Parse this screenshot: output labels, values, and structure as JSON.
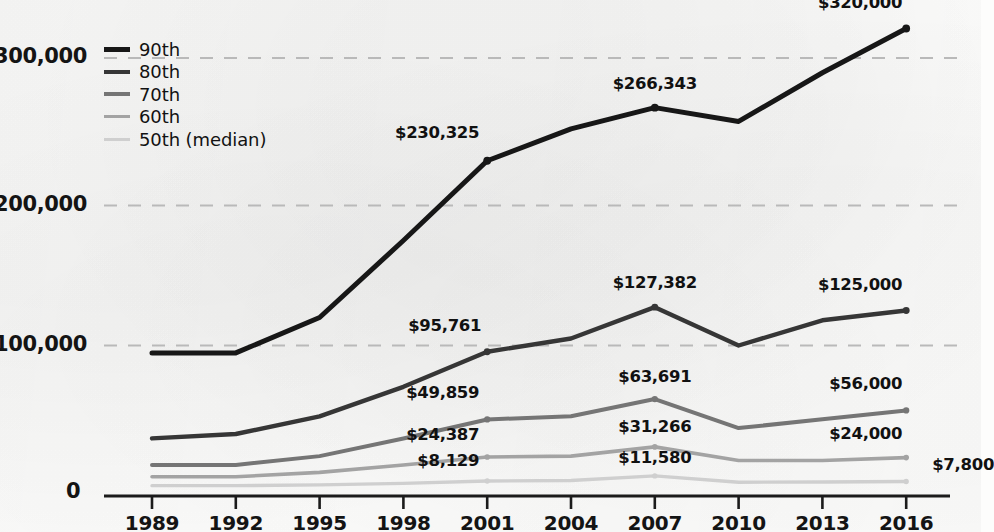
{
  "chart_data": {
    "type": "line",
    "title": "",
    "xlabel": "",
    "ylabel": "",
    "categories": [
      "1989",
      "1992",
      "1995",
      "1998",
      "2001",
      "2004",
      "2007",
      "2010",
      "2013",
      "2016"
    ],
    "ylim": [
      0,
      340000
    ],
    "yticks": [
      0,
      100000,
      200000,
      300000
    ],
    "ytick_labels": [
      "0",
      "100,000",
      "200,000",
      "300,000"
    ],
    "grid": "horizontal-dashed",
    "legend_position": "top-left",
    "series": [
      {
        "name": "90th",
        "color": "#171717",
        "width": 5.0,
        "values": [
          95000,
          95000,
          120000,
          175000,
          230325,
          252000,
          266343,
          257000,
          290000,
          320000
        ],
        "labels": [
          {
            "category": "2001",
            "text": "$230,325"
          },
          {
            "category": "2007",
            "text": "$266,343"
          },
          {
            "category": "2016",
            "text": "$320,000"
          }
        ]
      },
      {
        "name": "80th",
        "color": "#363636",
        "width": 4.4,
        "values": [
          37000,
          40000,
          52000,
          72000,
          95761,
          105000,
          127382,
          100000,
          118000,
          125000
        ],
        "labels": [
          {
            "category": "2001",
            "text": "$95,761"
          },
          {
            "category": "2007",
            "text": "$127,382"
          },
          {
            "category": "2016",
            "text": "$125,000"
          }
        ]
      },
      {
        "name": "70th",
        "color": "#757575",
        "width": 4.0,
        "values": [
          19000,
          19000,
          25000,
          37000,
          49859,
          52000,
          63691,
          44000,
          50000,
          56000
        ],
        "labels": [
          {
            "category": "2001",
            "text": "$49,859"
          },
          {
            "category": "2007",
            "text": "$63,691"
          },
          {
            "category": "2016",
            "text": "$56,000"
          }
        ]
      },
      {
        "name": "60th",
        "color": "#a3a3a3",
        "width": 3.6,
        "values": [
          11000,
          11000,
          14000,
          19000,
          24387,
          25000,
          31266,
          22000,
          22000,
          24000
        ],
        "labels": [
          {
            "category": "2001",
            "text": "$24,387"
          },
          {
            "category": "2007",
            "text": "$31,266"
          },
          {
            "category": "2016",
            "text": "$24,000"
          }
        ]
      },
      {
        "name": "50th (median)",
        "color": "#cfcfcf",
        "width": 3.4,
        "values": [
          5000,
          5000,
          5500,
          6500,
          8129,
          8500,
          11580,
          7300,
          7500,
          7800
        ],
        "labels": [
          {
            "category": "2001",
            "text": "$8,129"
          },
          {
            "category": "2007",
            "text": "$11,580"
          },
          {
            "category": "2016",
            "text": "$7,800"
          }
        ]
      }
    ]
  },
  "axis": {
    "y_labels": [
      {
        "text": "300,000",
        "value": 300000
      },
      {
        "text": "200,000",
        "value": 200000
      },
      {
        "text": "100,000",
        "value": 100000
      },
      {
        "text": "0",
        "value": 0
      }
    ],
    "x_labels": [
      "1989",
      "1992",
      "1995",
      "1998",
      "2001",
      "2004",
      "2007",
      "2010",
      "2013",
      "2016"
    ]
  },
  "legend": {
    "items": [
      {
        "label": "90th",
        "color": "#171717"
      },
      {
        "label": "80th",
        "color": "#363636"
      },
      {
        "label": "70th",
        "color": "#757575"
      },
      {
        "label": "60th",
        "color": "#a3a3a3"
      },
      {
        "label": "50th (median)",
        "color": "#cfcfcf"
      }
    ]
  }
}
